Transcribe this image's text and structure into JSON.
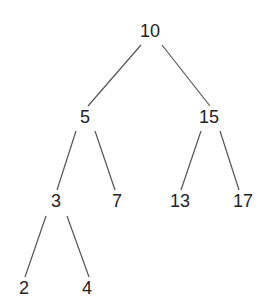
{
  "diagram": {
    "type": "binary-search-tree",
    "line_color": "#555555",
    "text_color": "#222222",
    "nodes": [
      {
        "id": "n10",
        "label": "10",
        "x": 150,
        "y": 31
      },
      {
        "id": "n5",
        "label": "5",
        "x": 85,
        "y": 117
      },
      {
        "id": "n15",
        "label": "15",
        "x": 209,
        "y": 117
      },
      {
        "id": "n3",
        "label": "3",
        "x": 56,
        "y": 201
      },
      {
        "id": "n7",
        "label": "7",
        "x": 117,
        "y": 201
      },
      {
        "id": "n13",
        "label": "13",
        "x": 180,
        "y": 201
      },
      {
        "id": "n17",
        "label": "17",
        "x": 243,
        "y": 201
      },
      {
        "id": "n2",
        "label": "2",
        "x": 24,
        "y": 288
      },
      {
        "id": "n4",
        "label": "4",
        "x": 87,
        "y": 288
      }
    ],
    "edges": [
      {
        "from": "10",
        "to": "5",
        "x1": 141,
        "y1": 45,
        "x2": 88,
        "y2": 106
      },
      {
        "from": "10",
        "to": "15",
        "x1": 162,
        "y1": 45,
        "x2": 210,
        "y2": 106
      },
      {
        "from": "5",
        "to": "3",
        "x1": 76,
        "y1": 131,
        "x2": 57,
        "y2": 190
      },
      {
        "from": "5",
        "to": "7",
        "x1": 95,
        "y1": 131,
        "x2": 115,
        "y2": 190
      },
      {
        "from": "15",
        "to": "13",
        "x1": 201,
        "y1": 131,
        "x2": 181,
        "y2": 190
      },
      {
        "from": "15",
        "to": "17",
        "x1": 220,
        "y1": 131,
        "x2": 239,
        "y2": 190
      },
      {
        "from": "3",
        "to": "2",
        "x1": 46,
        "y1": 216,
        "x2": 25,
        "y2": 277
      },
      {
        "from": "3",
        "to": "4",
        "x1": 67,
        "y1": 216,
        "x2": 89,
        "y2": 277
      }
    ]
  }
}
